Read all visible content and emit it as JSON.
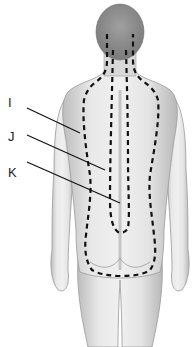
{
  "figure": {
    "labels": [
      {
        "id": "I",
        "text": "I",
        "x": 8,
        "y": 96,
        "line": [
          27,
          108,
          80,
          133
        ]
      },
      {
        "id": "J",
        "text": "J",
        "x": 8,
        "y": 130,
        "line": [
          27,
          135,
          105,
          170
        ]
      },
      {
        "id": "K",
        "text": "K",
        "x": 8,
        "y": 166,
        "line": [
          27,
          162,
          120,
          203
        ]
      }
    ],
    "colors": {
      "background": "#ffffff",
      "skin_fill": "#e6e6e6",
      "skin_shade": "#b5b5b5",
      "outline": "#8a8a8a",
      "dash": "#111111",
      "label_text": "#222222"
    }
  }
}
